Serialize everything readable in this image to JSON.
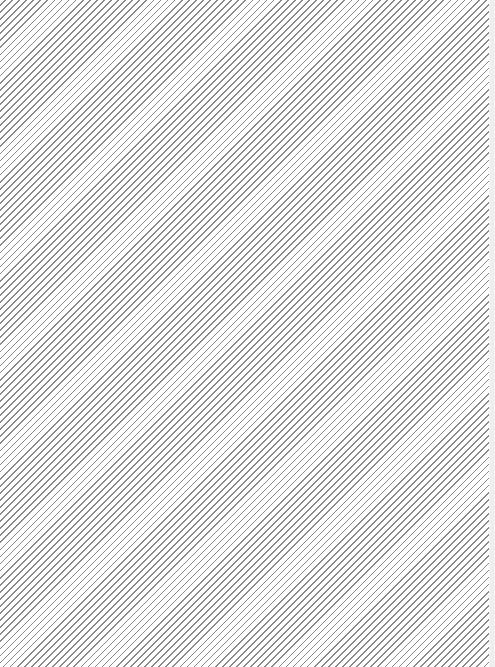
{
  "canvas": {
    "pattern": "diagonal-hatch",
    "line_color": "#8a8a8a",
    "background_color": "#ffffff"
  },
  "edge_strip": {
    "color": "#f4f4f4"
  }
}
